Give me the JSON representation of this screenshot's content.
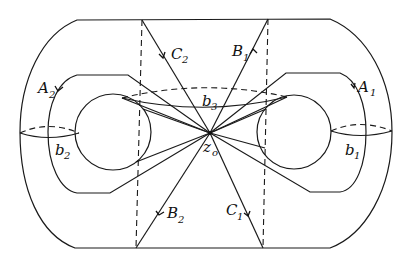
{
  "figure": {
    "base_point": {
      "name": "z",
      "subscript": "o"
    },
    "loops": [
      {
        "id": "A1",
        "name": "A",
        "subscript": "1"
      },
      {
        "id": "A2",
        "name": "A",
        "subscript": "2"
      },
      {
        "id": "B1",
        "name": "B",
        "subscript": "1"
      },
      {
        "id": "B2",
        "name": "B",
        "subscript": "2"
      },
      {
        "id": "C1",
        "name": "C",
        "subscript": "1"
      },
      {
        "id": "C2",
        "name": "C",
        "subscript": "2"
      },
      {
        "id": "b1",
        "name": "b",
        "subscript": "1"
      },
      {
        "id": "b2",
        "name": "b",
        "subscript": "2"
      },
      {
        "id": "b3",
        "name": "b",
        "subscript": "3"
      }
    ]
  }
}
